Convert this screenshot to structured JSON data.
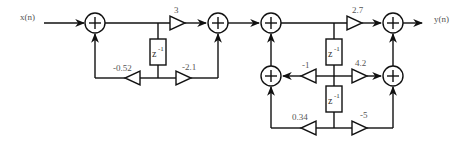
{
  "diagram": {
    "type": "signal-flow block diagram",
    "input_label": "x(n)",
    "output_label": "y(n)",
    "delay_label": "z",
    "delay_exponent": "-1",
    "section1": {
      "forward_gain": "3",
      "feedback_gain": "-0.52",
      "feedforward_gain": "-2.1"
    },
    "section2": {
      "forward_gain": "2.7",
      "feedback_gain_1": "-1",
      "feedforward_gain_1": "4.2",
      "feedback_gain_2": "0.34",
      "feedforward_gain_2": "-5"
    },
    "colors": {
      "line": "#111111",
      "label": "#555555",
      "background": "#ffffff"
    }
  }
}
